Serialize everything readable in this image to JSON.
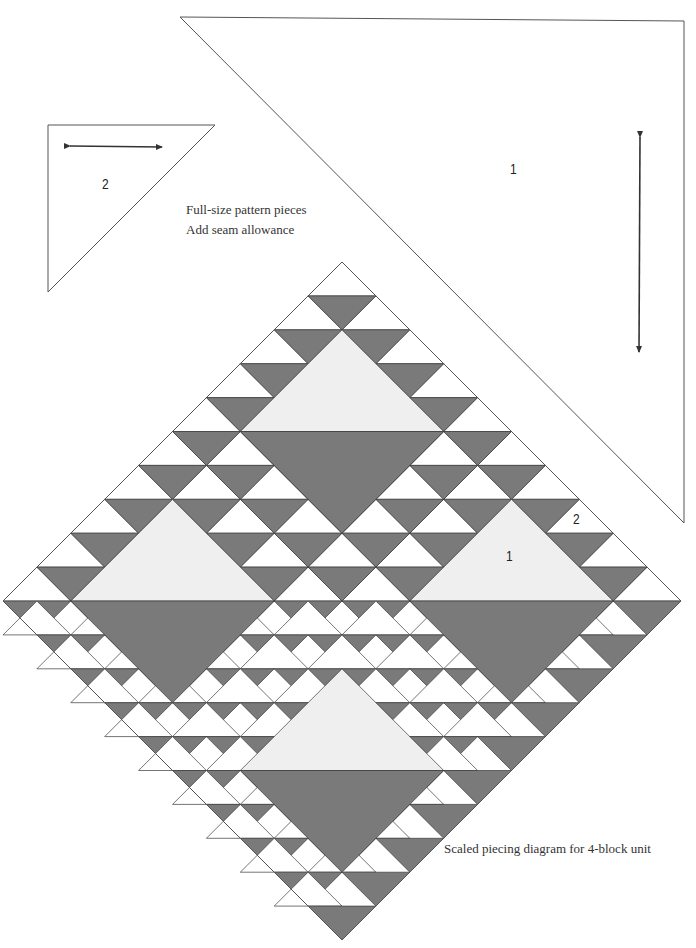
{
  "pattern_pieces": {
    "caption_line_1": "Full-size pattern pieces",
    "caption_line_2": "Add seam allowance",
    "piece_1": {
      "label": "1",
      "outline": [
        [
          180,
          17
        ],
        [
          684,
          21
        ],
        [
          684,
          523
        ]
      ],
      "grain_arrow": {
        "from": [
          640,
          137
        ],
        "to": [
          639,
          352
        ],
        "direction": "vertical"
      }
    },
    "piece_2": {
      "label": "2",
      "outline": [
        [
          48,
          125
        ],
        [
          215,
          125
        ],
        [
          48,
          292
        ]
      ],
      "grain_arrow": {
        "from": [
          70,
          146
        ],
        "to": [
          162,
          147
        ],
        "direction": "horizontal"
      }
    }
  },
  "piecing_diagram": {
    "caption": "Scaled piecing diagram for 4-block unit",
    "label_large": "1",
    "label_small": "2",
    "center_x": 342,
    "top_y": 262,
    "unit": 33.9,
    "rows": 20,
    "colors": {
      "dark": "#7a7a7a",
      "white": "#ffffff",
      "light": "#efefef",
      "line": "#3a3a3a"
    },
    "large_triangles": [
      {
        "block": "top",
        "shape": "up",
        "apex_row": 2,
        "center_offset": 0,
        "fill": "light"
      },
      {
        "block": "top",
        "shape": "down",
        "top_row": 5,
        "center_offset": 0,
        "fill": "dark"
      },
      {
        "block": "left",
        "shape": "up",
        "apex_row": 7,
        "center_offset": -5,
        "fill": "light"
      },
      {
        "block": "left",
        "shape": "down",
        "top_row": 10,
        "center_offset": -5,
        "fill": "dark"
      },
      {
        "block": "right",
        "shape": "up",
        "apex_row": 7,
        "center_offset": 5,
        "fill": "light"
      },
      {
        "block": "right",
        "shape": "down",
        "top_row": 10,
        "center_offset": 5,
        "fill": "dark"
      },
      {
        "block": "bottom",
        "shape": "up",
        "apex_row": 12,
        "center_offset": 0,
        "fill": "light"
      },
      {
        "block": "bottom",
        "shape": "down",
        "top_row": 15,
        "center_offset": 0,
        "fill": "dark"
      }
    ]
  }
}
